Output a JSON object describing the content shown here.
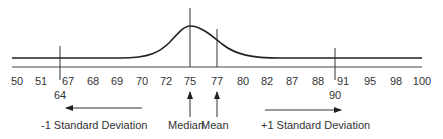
{
  "diagram": {
    "type": "skewed-distribution",
    "axis_ticks": [
      {
        "label": "50",
        "x": 17
      },
      {
        "label": "51",
        "x": 41
      },
      {
        "label": "67",
        "x": 67
      },
      {
        "label": "68",
        "x": 93
      },
      {
        "label": "69",
        "x": 117
      },
      {
        "label": "70",
        "x": 142
      },
      {
        "label": "72",
        "x": 167
      },
      {
        "label": "75",
        "x": 190
      },
      {
        "label": "77",
        "x": 216
      },
      {
        "label": "80",
        "x": 243
      },
      {
        "label": "82",
        "x": 267
      },
      {
        "label": "87",
        "x": 292
      },
      {
        "label": "88",
        "x": 318
      },
      {
        "label": "91",
        "x": 343
      },
      {
        "label": "95",
        "x": 370
      },
      {
        "label": "98",
        "x": 396
      },
      {
        "label": "100",
        "x": 422
      }
    ],
    "markers": {
      "minus_one_sd_value": "64",
      "plus_one_sd_value": "90"
    },
    "labels": {
      "minus_sd": "-1 Standard Deviation",
      "median": "Median",
      "mean": "Mean",
      "plus_sd": "+1 Standard Deviation"
    },
    "stats": {
      "median": 75,
      "mean": 77,
      "minus_one_sd": 64,
      "plus_one_sd": 90
    }
  }
}
